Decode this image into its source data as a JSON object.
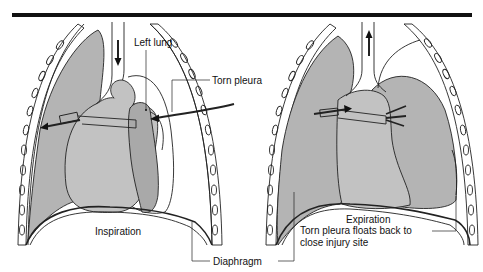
{
  "figure": {
    "panels": [
      {
        "id": "inspiration",
        "caption": "Inspiration",
        "labels": {
          "left_lung": "Left lung",
          "torn_pleura": "Torn pleura"
        },
        "airflow_direction": "down"
      },
      {
        "id": "expiration",
        "caption": "Expiration",
        "note_line1": "Torn pleura floats back to",
        "note_line2": "close injury site",
        "airflow_direction": "up"
      }
    ],
    "shared_label": "Diaphragm"
  },
  "colors": {
    "lung_fill": "#b4b4b4",
    "heart_fill": "#c2c2c2",
    "stroke": "#222222",
    "top_rule": "#111111",
    "background": "#ffffff"
  }
}
